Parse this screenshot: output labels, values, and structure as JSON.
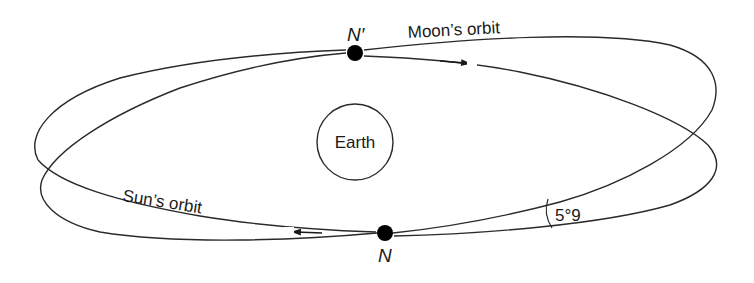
{
  "diagram": {
    "type": "orbit-inclination",
    "labels": {
      "moon_orbit": "Moon’s orbit",
      "sun_orbit": "Sun’s orbit",
      "earth": "Earth",
      "ascending_node": "N",
      "descending_node": "N′",
      "inclination": "5°9"
    },
    "nodes": [
      {
        "id": "N_prime",
        "label": "N′",
        "x": 355,
        "y": 53
      },
      {
        "id": "N",
        "label": "N",
        "x": 385,
        "y": 233
      }
    ],
    "earth": {
      "cx": 355,
      "cy": 142,
      "r": 38
    },
    "colors": {
      "line": "#2a2a2a",
      "node": "#000000",
      "background": "#ffffff"
    }
  }
}
